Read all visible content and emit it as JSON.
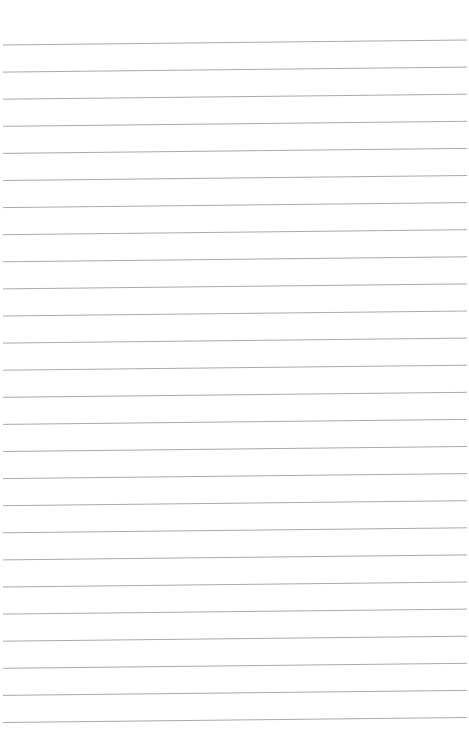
{
  "page": {
    "type": "ruled-notebook-paper",
    "background_color": "#ffffff",
    "line_color": "#a9a9a9",
    "line_count": 26,
    "first_line_y_left": 45,
    "first_line_y_right": 40,
    "line_spacing": 27.1,
    "line_x_start": 3,
    "line_x_end": 467
  }
}
